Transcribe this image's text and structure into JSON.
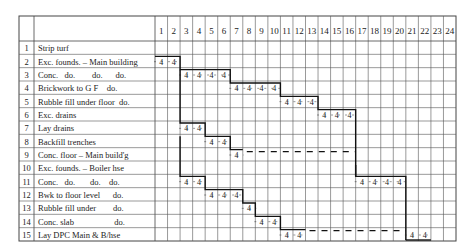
{
  "chart_data": {
    "type": "table",
    "title": "",
    "week_columns": [
      "1",
      "2",
      "3",
      "4",
      "5",
      "6",
      "7",
      "8",
      "9",
      "10",
      "11",
      "12",
      "13",
      "14",
      "15",
      "16",
      "17",
      "18",
      "19",
      "20",
      "21",
      "22",
      "23",
      "24"
    ],
    "activities": [
      {
        "no": "1",
        "label": "Strip turf",
        "start": 1,
        "end": 2,
        "marks": "4–4"
      },
      {
        "no": "2",
        "label": "Exc. founds. – Main building",
        "start": 3,
        "end": 6,
        "marks": "4–4–4–4"
      },
      {
        "no": "3",
        "label": "Conc.  do.       do.     do.",
        "start": 7,
        "end": 10,
        "marks": "4–4–4–4"
      },
      {
        "no": "4",
        "label": "Brickwork to G F   do.",
        "start": 11,
        "end": 13,
        "marks": "4–4–4"
      },
      {
        "no": "5",
        "label": "Rubble fill under floor  do.",
        "start": 14,
        "end": 16,
        "marks": "4–4–4"
      },
      {
        "no": "6",
        "label": "Exc. drains",
        "start": null,
        "end": null,
        "marks": ""
      },
      {
        "no": "7",
        "label": "Lay drains",
        "start": 3,
        "end": 4,
        "marks": "4–4"
      },
      {
        "no": "8",
        "label": "Backfill trenches",
        "start": 5,
        "end": 6,
        "marks": "4–4"
      },
      {
        "no": "9",
        "label": "Conc. floor – Main build'g",
        "start": 7,
        "end": 7,
        "marks": "4",
        "float_to": 17
      },
      {
        "no": "10",
        "label": "Exc. founds. – Boiler hse",
        "start": 18,
        "end": 21,
        "marks": "4–4–4–4"
      },
      {
        "no": "11",
        "label": "Conc.  do.      do.   do.",
        "start": 3,
        "end": 4,
        "marks": "4–4"
      },
      {
        "no": "12",
        "label": "Bwk to floor level    do.",
        "start": 5,
        "end": 7,
        "marks": "4–4–4"
      },
      {
        "no": "13",
        "label": "Rubble fill under      do.",
        "start": 8,
        "end": 8,
        "marks": "4"
      },
      {
        "no": "14",
        "label": "Conc. slab                 do.",
        "start": 9,
        "end": 10,
        "marks": "4–4"
      },
      {
        "no": "15",
        "label": "Lay DPC Main & B/hse",
        "start": 11,
        "end": 12,
        "marks": "4–4",
        "float_to": 21,
        "second_start": 22,
        "second_end": 23
      }
    ],
    "legend": "Bars marked with crew size 4 per week; dashed lines denote float",
    "grid": true
  },
  "rows_display": [
    {
      "no": "1",
      "label": "Strip turf"
    },
    {
      "no": "2",
      "label": "Exc. founds. – Main building"
    },
    {
      "no": "3",
      "label": "Conc.   do.        do.      do."
    },
    {
      "no": "4",
      "label": "Brickwork to G F    do."
    },
    {
      "no": "5",
      "label": "Rubble fill under floor  do."
    },
    {
      "no": "6",
      "label": "Exc. drains"
    },
    {
      "no": "7",
      "label": "Lay drains"
    },
    {
      "no": "8",
      "label": "Backfill trenches"
    },
    {
      "no": "9",
      "label": "Conc. floor – Main build'g"
    },
    {
      "no": "10",
      "label": "Exc. founds. – Boiler hse"
    },
    {
      "no": "11",
      "label": "Conc.   do.       do.    do."
    },
    {
      "no": "12",
      "label": "Bwk to floor level      do."
    },
    {
      "no": "13",
      "label": "Rubble fill under        do."
    },
    {
      "no": "14",
      "label": "Conc. slab                   do."
    },
    {
      "no": "15",
      "label": "Lay DPC Main & B/hse"
    }
  ],
  "colors": {
    "line": "#222222",
    "grid": "#555555",
    "text": "#222222"
  }
}
